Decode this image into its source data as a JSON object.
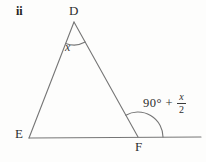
{
  "figure": {
    "item_label": "ii",
    "type": "triangle-exterior-angle-diagram",
    "vertices": {
      "top": "D",
      "bottom_left": "E",
      "bottom_right": "F"
    },
    "angle_at_d": {
      "label": "x"
    },
    "angle_at_f": {
      "prefix": "90° +",
      "numerator": "x",
      "denominator": "2"
    },
    "colors": {
      "line": "#767676",
      "text": "#2e2e2e",
      "background": "#fdfdfc"
    }
  }
}
